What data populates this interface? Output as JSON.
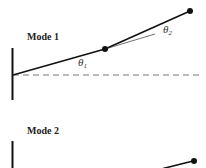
{
  "diagram": {
    "mode1": {
      "label": "Mode 1",
      "theta1": "θ",
      "theta1_sub": "1",
      "theta2": "θ",
      "theta2_sub": "2"
    },
    "mode2": {
      "label": "Mode 2"
    },
    "colors": {
      "line": "#111111",
      "dashed": "#777777"
    }
  }
}
